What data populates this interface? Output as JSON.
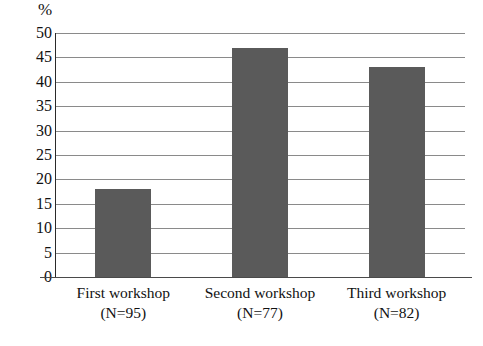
{
  "chart_data": {
    "type": "bar",
    "title": "",
    "subtitle": "",
    "xlabel": "",
    "ylabel": "%",
    "unit_label": "%",
    "categories": [
      "First workshop",
      "Second workshop",
      "Third workshop"
    ],
    "category_sublabels": [
      "(N=95)",
      "(N=77)",
      "(N=82)"
    ],
    "sample_sizes": [
      95,
      77,
      82
    ],
    "values": [
      18,
      47,
      43
    ],
    "ylim": [
      0,
      50
    ],
    "ytick_step": 5,
    "ytick_labels": [
      "50",
      "45",
      "40",
      "35",
      "30",
      "25",
      "20",
      "15",
      "10",
      "5",
      "0"
    ],
    "ytick_values": [
      50,
      45,
      40,
      35,
      30,
      25,
      20,
      15,
      10,
      5,
      0
    ],
    "grid": true,
    "grid_orientation": "horizontal",
    "legend": false,
    "legend_position": "none",
    "bar_color": "#5a5a5a",
    "gridline_color": "#8a8a8a",
    "axis_color": "#2a2a2a",
    "background_color": "#ffffff"
  }
}
